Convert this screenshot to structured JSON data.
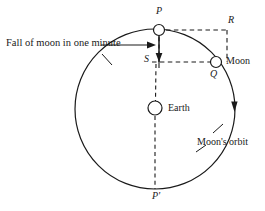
{
  "figure": {
    "name": "moon-fall-orbit-diagram",
    "background_color": "#ffffff",
    "stroke_color": "#1a1a1a",
    "width": 265,
    "height": 211
  },
  "labels": {
    "fall_caption": "Fall of moon in one minute",
    "point_p": "P",
    "point_p_prime": "P'",
    "point_r": "R",
    "point_s": "S",
    "point_q": "Q",
    "moon": "Moon",
    "earth": "Earth",
    "orbit": "Moon's orbit"
  },
  "geometry": {
    "orbit_center": {
      "x": 155,
      "y": 109
    },
    "orbit_radius": 80,
    "earth_marker": {
      "x": 155,
      "y": 108,
      "r": 7
    },
    "moon_start_marker": {
      "x": 159,
      "y": 30,
      "r": 5.5
    },
    "moon_end_marker": {
      "x": 216,
      "y": 62,
      "r": 5.5
    },
    "point_r_corner": {
      "x": 227,
      "y": 30
    },
    "point_s_corner": {
      "x": 159,
      "y": 62
    },
    "fall_arrow": {
      "from_y": 34,
      "to_y": 61,
      "x": 159
    },
    "orbit_direction_arrow": {
      "x": 234,
      "y": 107
    },
    "caption_arrow": {
      "from_x": 101,
      "to_x": 153,
      "y": 45
    }
  }
}
